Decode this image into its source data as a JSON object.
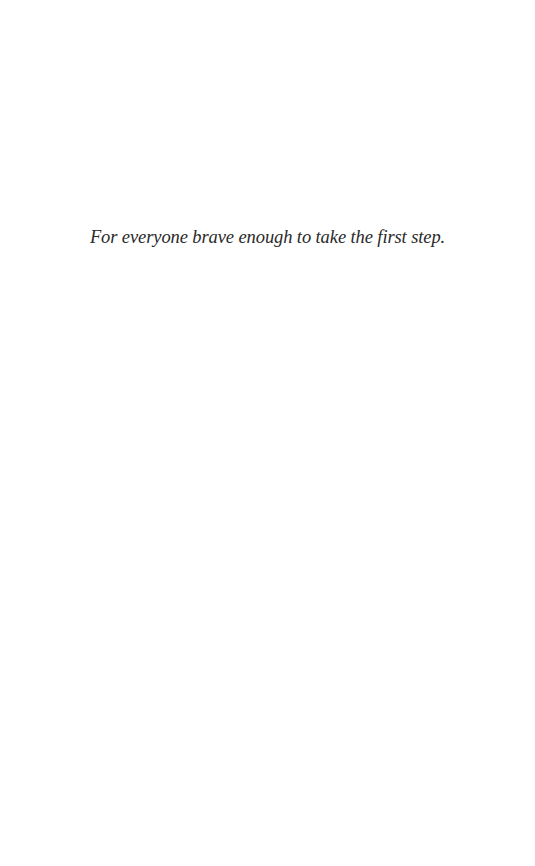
{
  "page": {
    "type": "dedication",
    "dedication_text": "For everyone brave enough to take the first step."
  }
}
